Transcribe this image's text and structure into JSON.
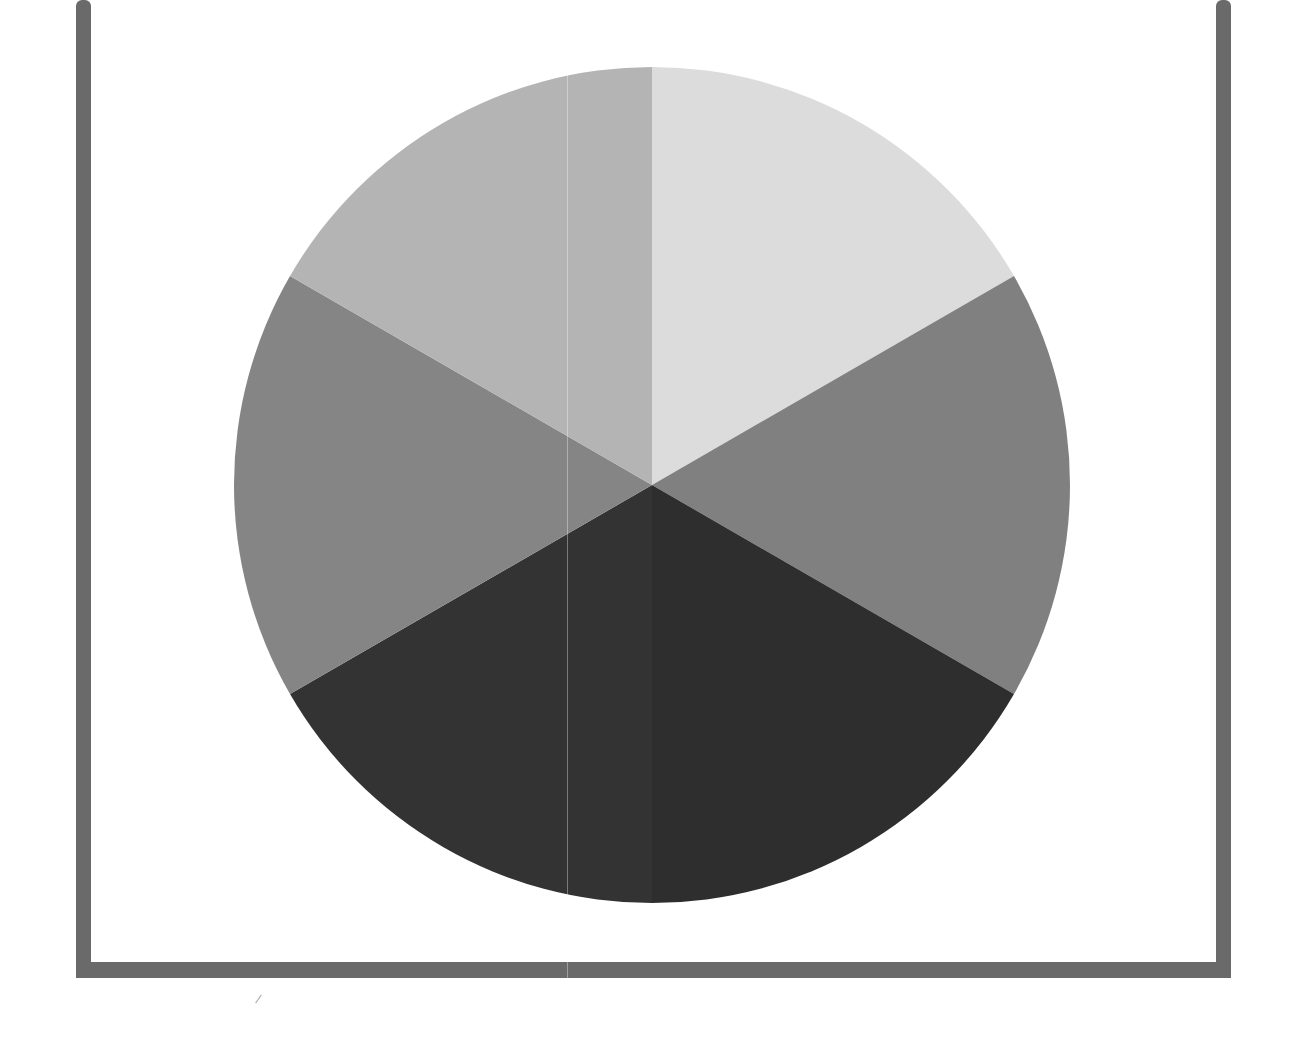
{
  "chart_data": {
    "type": "pie",
    "title": "",
    "categories": [
      "Slice 1",
      "Slice 2",
      "Slice 3",
      "Slice 4",
      "Slice 5",
      "Slice 6"
    ],
    "values": [
      16.67,
      16.67,
      16.67,
      16.67,
      16.67,
      16.67
    ],
    "colors": [
      "#dcdcdc",
      "#808080",
      "#2e2e2e",
      "#333333",
      "#858585",
      "#b4b4b4"
    ],
    "start_angle_deg": 0,
    "direction": "clockwise",
    "legend": "none",
    "labels_shown": false
  },
  "layout": {
    "center": [
      652,
      485
    ],
    "radius": 418,
    "frame_color": "#6a6a6a"
  }
}
